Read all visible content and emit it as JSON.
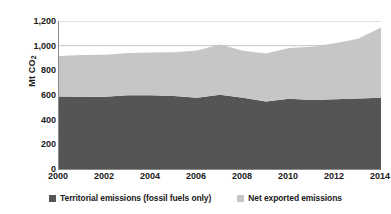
{
  "chart_data": {
    "type": "area",
    "stacked": true,
    "title": "",
    "xlabel": "",
    "ylabel": "Mt CO2",
    "ylabel_display": "Mt CO",
    "ylabel_sub": "2",
    "xlim": [
      2000,
      2014
    ],
    "ylim": [
      0,
      1200
    ],
    "grid": "horizontal",
    "gridlines": [
      1000,
      1200
    ],
    "legend_position": "bottom",
    "x": [
      2000,
      2001,
      2002,
      2003,
      2004,
      2005,
      2006,
      2007,
      2008,
      2009,
      2010,
      2011,
      2012,
      2013,
      2014
    ],
    "x_tick_labels": [
      "2000",
      "2002",
      "2004",
      "2006",
      "2008",
      "2010",
      "2012",
      "2014"
    ],
    "y_tick_labels": [
      "0",
      "200",
      "400",
      "600",
      "800",
      "1,000",
      "1,200"
    ],
    "y_tick_values": [
      0,
      200,
      400,
      600,
      800,
      1000,
      1200
    ],
    "series": [
      {
        "name": "Territorial emissions (fossil fuels only)",
        "color": "#555555",
        "values": [
          588,
          586,
          585,
          598,
          597,
          592,
          578,
          602,
          577,
          548,
          570,
          560,
          565,
          572,
          578
        ]
      },
      {
        "name": "Net exported emissions",
        "color": "#c6c6c6",
        "values": [
          328,
          338,
          342,
          342,
          348,
          355,
          382,
          408,
          382,
          388,
          412,
          432,
          455,
          485,
          570
        ]
      }
    ],
    "totals": [
      916,
      924,
      927,
      940,
      945,
      947,
      960,
      1010,
      959,
      936,
      982,
      992,
      1020,
      1057,
      1148
    ]
  },
  "legend": {
    "items": [
      {
        "label": "Territorial emissions (fossil fuels only)",
        "color": "#555555"
      },
      {
        "label": "Net exported emissions",
        "color": "#c6c6c6"
      }
    ]
  },
  "colors": {
    "territorial": "#555555",
    "net_exported": "#c6c6c6",
    "axis": "#8a8a8a",
    "grid": "#b5b5b5",
    "text": "#1a1a1a",
    "background": "#ffffff"
  }
}
